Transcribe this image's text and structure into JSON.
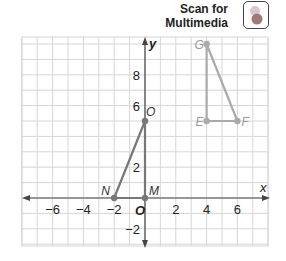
{
  "header": {
    "scan_line1": "Scan for",
    "scan_line2": "Multimedia",
    "icon": "multimedia-qr-icon"
  },
  "graph": {
    "x_label": "x",
    "y_label": "y",
    "origin_label": "O",
    "x_ticks": [
      "−6",
      "−4",
      "−2",
      "2",
      "4",
      "6"
    ],
    "y_ticks": [
      "8",
      "6",
      "2",
      "−2"
    ],
    "points": {
      "N": {
        "label": "N",
        "x": -2,
        "y": 0
      },
      "M": {
        "label": "M",
        "x": 0,
        "y": 0
      },
      "O": {
        "label": "O",
        "x": 0,
        "y": 5
      },
      "G": {
        "label": "G",
        "x": 4,
        "y": 10
      },
      "E": {
        "label": "E",
        "x": 4,
        "y": 5
      },
      "F": {
        "label": "F",
        "x": 6,
        "y": 5
      }
    },
    "colors": {
      "triangle_MNO": "#777777",
      "triangle_EFG": "#aaaaaa",
      "grid": "#d6d6d6",
      "axis": "#444444"
    }
  }
}
